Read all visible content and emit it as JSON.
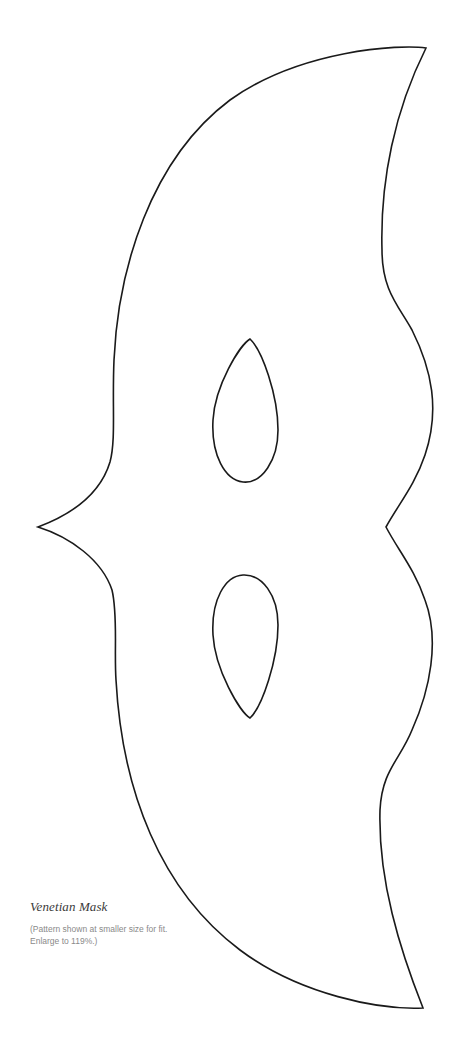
{
  "pattern": {
    "name": "Venetian Mask",
    "stroke_color": "#1a1a1a",
    "background_color": "#ffffff",
    "parts": [
      "outline",
      "eye-hole-top",
      "eye-hole-bottom"
    ]
  },
  "caption": {
    "title": "Venetian Mask",
    "note_line_1": "(Pattern shown at smaller size for fit.",
    "note_line_2": "Enlarge to 119%.)"
  }
}
